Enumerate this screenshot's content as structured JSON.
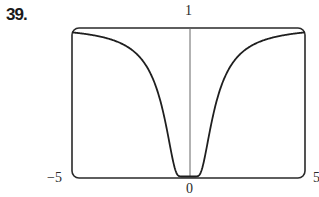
{
  "problem": {
    "number": "39."
  },
  "chart_data": {
    "type": "line",
    "title": "",
    "xlabel": "",
    "ylabel": "",
    "xlim": [
      -5,
      5
    ],
    "ylim": [
      0,
      1
    ],
    "grid": false,
    "legend": null,
    "tick_labels": {
      "x_left": "−5",
      "x_center": "0",
      "x_right": "5",
      "y_top": "1"
    },
    "series": [
      {
        "name": "curve",
        "x": [
          -5,
          -4,
          -3,
          -2.5,
          -2,
          -1.5,
          -1.25,
          -1,
          -0.8,
          -0.6,
          -0.5,
          -0.4,
          -0.3,
          0,
          0.3,
          0.4,
          0.5,
          0.6,
          0.8,
          1,
          1.25,
          1.5,
          2,
          2.5,
          3,
          4,
          5
        ],
        "y": [
          0.96,
          0.94,
          0.89,
          0.85,
          0.78,
          0.64,
          0.53,
          0.37,
          0.21,
          0.06,
          0.02,
          0.002,
          0.0,
          0.0,
          0.0,
          0.002,
          0.02,
          0.06,
          0.21,
          0.37,
          0.53,
          0.64,
          0.78,
          0.85,
          0.89,
          0.94,
          0.96
        ]
      }
    ],
    "colors": {
      "frame": "#2a2a2a",
      "curve": "#1f1f1f",
      "axis": "#555555"
    }
  }
}
